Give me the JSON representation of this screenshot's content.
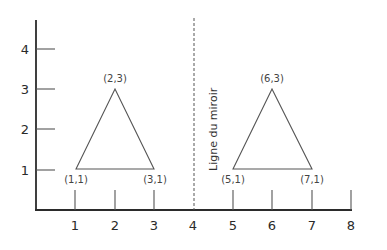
{
  "diagram": {
    "title": "",
    "mirror_line": {
      "label": "Ligne du miroir",
      "x": 4,
      "style": "dashed"
    },
    "x_axis": {
      "ticks": [
        "1",
        "2",
        "3",
        "4",
        "5",
        "6",
        "7",
        "8"
      ]
    },
    "y_axis": {
      "ticks": [
        "1",
        "2",
        "3",
        "4"
      ]
    },
    "triangles": [
      {
        "name": "original",
        "vertices": [
          {
            "x": 1,
            "y": 1,
            "label": "(1,1)"
          },
          {
            "x": 2,
            "y": 3,
            "label": "(2,3)"
          },
          {
            "x": 3,
            "y": 1,
            "label": "(3,1)"
          }
        ]
      },
      {
        "name": "reflection",
        "vertices": [
          {
            "x": 5,
            "y": 1,
            "label": "(5,1)"
          },
          {
            "x": 6,
            "y": 3,
            "label": "(6,3)"
          },
          {
            "x": 7,
            "y": 1,
            "label": "(7,1)"
          }
        ]
      }
    ],
    "colors": {
      "axis": "#2b2b2b",
      "line": "#555555",
      "text": "#2a2a2a"
    }
  }
}
